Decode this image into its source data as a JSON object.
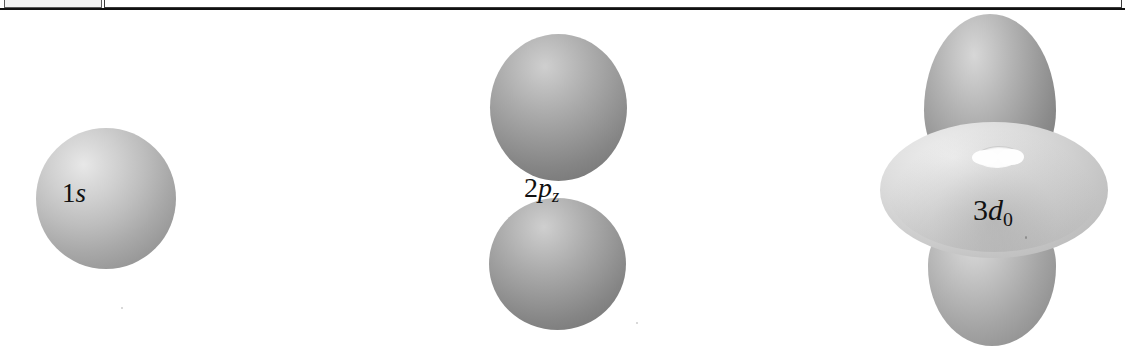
{
  "browser": {
    "address_bar": {
      "url": "p://www.mathcurve.com/websmathematical/hydrogen/hydrogen.jsp",
      "placeholder": "Address"
    }
  },
  "figure": {
    "background_color": "#ffffff",
    "orbitals": [
      {
        "id": "1s",
        "label_main": "1",
        "label_italic": "s",
        "label_sub": "",
        "shape": "sphere",
        "description": "single spherical lobe",
        "fill_color": "#b8b8b8",
        "highlight_color": "#e8e8e8"
      },
      {
        "id": "2pz",
        "label_main": "2",
        "label_italic": "p",
        "label_sub": "z",
        "shape": "dumbbell",
        "description": "two lobes above and below the nodal plane",
        "fill_color": "#a9a9a9",
        "highlight_color": "#e4e4e4"
      },
      {
        "id": "3d0",
        "label_main": "3",
        "label_italic": "d",
        "label_sub": "0",
        "shape": "dumbbell-with-torus",
        "description": "two axial lobes plus an equatorial torus with a central hole",
        "fill_color": "#9d9d9d",
        "torus_color": "#d0d0d0",
        "highlight_color": "#f0f0f0"
      }
    ]
  }
}
